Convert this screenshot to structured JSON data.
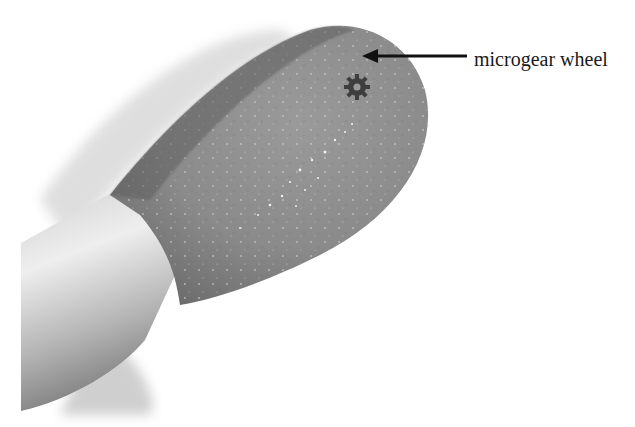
{
  "image": {
    "subject": "match head with microgear wheel on tip",
    "style": "grayscale halftone photograph"
  },
  "annotation": {
    "label": "microgear wheel",
    "pointer": "arrow"
  },
  "colors": {
    "background": "#ffffff",
    "match_head": "#8a8a8a",
    "match_head_dark": "#5e5e5e",
    "stick": "#c8c8c8",
    "stick_highlight": "#ececec",
    "shadow": "#d6d6d6",
    "gear": "#4a4a4a",
    "arrow": "#111111"
  }
}
